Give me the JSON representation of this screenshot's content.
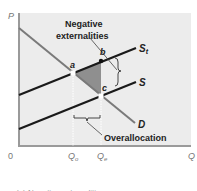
{
  "diagram": {
    "title_annotation": "Negative externalities",
    "title_annotation_lines": [
      "Negative",
      "externalities"
    ],
    "overallocation_label": "Overallocation",
    "axis": {
      "y_label": "P",
      "x_label": "Q",
      "origin_label": "0",
      "x_ticks": [
        {
          "label": "Qo",
          "main": "Q",
          "sub": "o",
          "x": 73
        },
        {
          "label": "Qe",
          "main": "Q",
          "sub": "e",
          "x": 101
        }
      ]
    },
    "curves": [
      {
        "name": "D",
        "label": "D",
        "color": "#7a7a7a",
        "from": [
          19,
          28
        ],
        "to": [
          135,
          123
        ]
      },
      {
        "name": "St",
        "label": "S",
        "label_sub": "t",
        "color": "#1a1a1a",
        "from": [
          19,
          95
        ],
        "to": [
          136,
          48
        ]
      },
      {
        "name": "S",
        "label": "S",
        "color": "#1a1a1a",
        "from": [
          19,
          129
        ],
        "to": [
          136,
          82
        ]
      }
    ],
    "points": [
      {
        "label": "a",
        "x": 73,
        "y": 73,
        "style": "open"
      },
      {
        "label": "b",
        "x": 101,
        "y": 61,
        "style": "filled"
      },
      {
        "label": "c",
        "x": 101,
        "y": 96,
        "style": "open"
      }
    ],
    "shaded_region": {
      "vertices": [
        "a",
        "b",
        "c"
      ],
      "color": "#8f8f8f"
    },
    "colors": {
      "plot_background": "#ececec",
      "axis": "#9a9a9a",
      "demand": "#7a7a7a",
      "supply": "#1a1a1a",
      "shading": "#8f8f8f"
    },
    "caption": "(a) Negative externalities"
  }
}
